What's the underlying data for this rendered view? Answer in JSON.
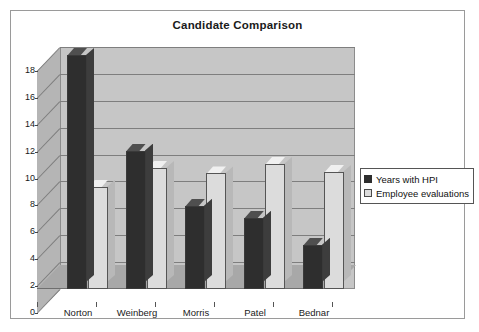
{
  "chart_data": {
    "type": "bar",
    "title": "Candidate Comparison",
    "xlabel": "",
    "ylabel": "",
    "categories": [
      "Norton",
      "Weinberg",
      "Morris",
      "Patel",
      "Bednar"
    ],
    "series": [
      {
        "name": "Years with HPI",
        "values": [
          17.4,
          10.3,
          6.2,
          5.3,
          3.3
        ],
        "color": "#2e2e2e"
      },
      {
        "name": "Employee evaluations",
        "values": [
          7.6,
          9.0,
          8.6,
          9.3,
          8.7
        ],
        "color": "#dcdcdc"
      }
    ],
    "ylim": [
      0,
      18
    ],
    "yticks": [
      "0",
      "2",
      "4",
      "6",
      "8",
      "10",
      "12",
      "14",
      "16",
      "18"
    ],
    "ytick_values": [
      0,
      2,
      4,
      6,
      8,
      10,
      12,
      14,
      16,
      18
    ],
    "grid": true,
    "legend_position": "right",
    "style": "3d-column",
    "plot_area_color": "#c6c6c6",
    "background_color": "#ffffff",
    "border_color": "#9a9a9a"
  },
  "legend": {
    "items": [
      {
        "label": "Years with HPI",
        "swatch": "dark-square-swatch"
      },
      {
        "label": "Employee evaluations",
        "swatch": "light-square-swatch"
      }
    ]
  }
}
